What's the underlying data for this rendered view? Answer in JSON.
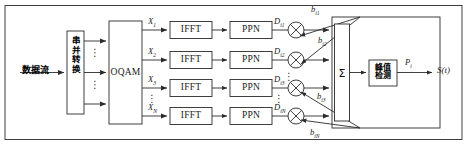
{
  "figure": {
    "line_color": "#2b2b2b",
    "box_fill": "#ffffff",
    "text_color": "#1a1a1a"
  },
  "input": {
    "label": "数据流",
    "name": "data-stream"
  },
  "serial_parallel": {
    "label": "串并转换",
    "name": "serial-to-parallel-converter"
  },
  "oqam": {
    "label": "OQAM"
  },
  "dots": {
    "vertical": "⋮"
  },
  "rows": [
    {
      "x_label": "X",
      "x_sub": "1",
      "ifft": "IFFT",
      "ppn": "PPN",
      "d_label": "D",
      "d_sub": "i1",
      "b_label": "b",
      "b_sub": "i1"
    },
    {
      "x_label": "X",
      "x_sub": "2",
      "ifft": "IFFT",
      "ppn": "PPN",
      "d_label": "D",
      "d_sub": "i2",
      "b_label": "b",
      "b_sub": "i2"
    },
    {
      "x_label": "X",
      "x_sub": "3",
      "ifft": "IFFT",
      "ppn": "PPN",
      "d_label": "D",
      "d_sub": "i3",
      "b_label": "b",
      "b_sub": "i3"
    },
    {
      "x_label": "X",
      "x_sub": "N",
      "ifft": "IFFT",
      "ppn": "PPN",
      "d_label": "D",
      "d_sub": "iN",
      "b_label": "b",
      "b_sub": "iN"
    }
  ],
  "summer": {
    "label": "Σ",
    "name": "summation"
  },
  "peak_detect": {
    "line1": "峰值",
    "line2": "检测"
  },
  "outputs": {
    "p_label": "P",
    "p_sub": "i",
    "s_label": "S(t)"
  }
}
